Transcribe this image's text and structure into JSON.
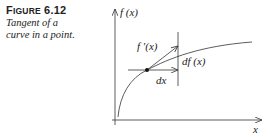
{
  "caption": {
    "label_first": "F",
    "label_rest": "IGURE",
    "number": "6.12",
    "text_line1": "Tangent of a",
    "text_line2": "curve in a point."
  },
  "figure": {
    "y_axis_label": "f (x)",
    "x_axis_label": "x",
    "tangent_label": "f ′(x)",
    "dx_label": "dx",
    "df_label": "df (x)"
  }
}
